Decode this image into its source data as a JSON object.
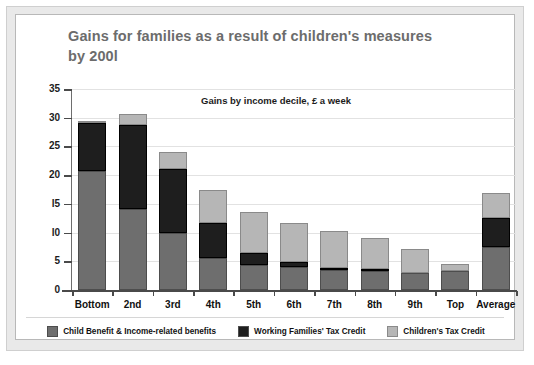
{
  "figure": {
    "title": "Gains for families as a result of children's measures by 200l",
    "subtitle": "Gains by income decile, £ a week"
  },
  "legend": {
    "items": [
      {
        "label": "Child Benefit & Income-related benefits",
        "swatch_name": "legend-swatch-child-benefit",
        "color": "#6e6e6e"
      },
      {
        "label": "Working Families' Tax Credit",
        "swatch_name": "legend-swatch-wftc",
        "color": "#1e1e1e"
      },
      {
        "label": "Children's Tax Credit",
        "swatch_name": "legend-swatch-ctc",
        "color": "#b6b6b6"
      }
    ]
  },
  "axes": {
    "y_ticks": [
      "0",
      "5",
      "l0",
      "l5",
      "20",
      "25",
      "30",
      "35"
    ],
    "y_min": 0,
    "y_max": 35
  },
  "chart_data": {
    "type": "bar",
    "title": "Gains for families as a result of children's measures by 200l",
    "subtitle": "Gains by income decile, £ a week",
    "xlabel": "",
    "ylabel": "£ a week",
    "ylim": [
      0,
      35
    ],
    "yticks": [
      0,
      5,
      10,
      15,
      20,
      25,
      30,
      35
    ],
    "grid": true,
    "stacked": true,
    "legend_position": "bottom",
    "categories": [
      "Bottom",
      "2nd",
      "3rd",
      "4th",
      "5th",
      "6th",
      "7th",
      "8th",
      "9th",
      "Top",
      "Average"
    ],
    "series": [
      {
        "name": "Child Benefit & Income-related benefits",
        "color": "#6e6e6e",
        "values": [
          20.7,
          14.1,
          10.0,
          5.6,
          4.4,
          4.0,
          3.4,
          3.3,
          2.9,
          3.3,
          7.5
        ]
      },
      {
        "name": "Working Families' Tax Credit",
        "color": "#1e1e1e",
        "values": [
          8.3,
          14.7,
          11.0,
          6.1,
          2.1,
          0.8,
          0.5,
          0.3,
          0.0,
          0.0,
          5.0
        ]
      },
      {
        "name": "Children's Tax Credit",
        "color": "#b6b6b6",
        "values": [
          0.3,
          1.8,
          3.0,
          5.7,
          7.1,
          6.8,
          6.3,
          5.4,
          4.3,
          1.3,
          4.4
        ]
      }
    ],
    "totals": [
      29.3,
      30.6,
      24.0,
      17.4,
      13.6,
      11.6,
      10.2,
      9.0,
      7.2,
      4.6,
      16.9
    ]
  }
}
